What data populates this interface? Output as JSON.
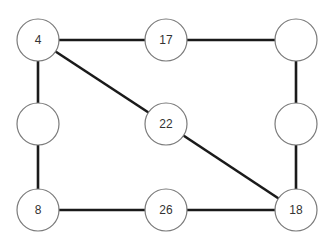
{
  "diagram": {
    "type": "graph",
    "colors": {
      "edge": "#1a1a1a",
      "node_stroke": "#7a7a7a",
      "node_fill": "#ffffff",
      "label": "#333333",
      "background": "#ffffff"
    },
    "nodes": [
      {
        "id": "n1",
        "label": "4",
        "x": 38,
        "y": 40
      },
      {
        "id": "n2",
        "label": "17",
        "x": 166,
        "y": 40
      },
      {
        "id": "n3",
        "label": "",
        "x": 296,
        "y": 40
      },
      {
        "id": "n4",
        "label": "",
        "x": 38,
        "y": 124
      },
      {
        "id": "n5",
        "label": "22",
        "x": 166,
        "y": 124
      },
      {
        "id": "n6",
        "label": "",
        "x": 296,
        "y": 124
      },
      {
        "id": "n7",
        "label": "8",
        "x": 38,
        "y": 210
      },
      {
        "id": "n8",
        "label": "26",
        "x": 166,
        "y": 210
      },
      {
        "id": "n9",
        "label": "18",
        "x": 296,
        "y": 210
      }
    ],
    "edges": [
      {
        "from": "n1",
        "to": "n2"
      },
      {
        "from": "n2",
        "to": "n3"
      },
      {
        "from": "n1",
        "to": "n4"
      },
      {
        "from": "n4",
        "to": "n7"
      },
      {
        "from": "n1",
        "to": "n5"
      },
      {
        "from": "n5",
        "to": "n9"
      },
      {
        "from": "n3",
        "to": "n6"
      },
      {
        "from": "n6",
        "to": "n9"
      },
      {
        "from": "n7",
        "to": "n8"
      },
      {
        "from": "n8",
        "to": "n9"
      }
    ]
  }
}
